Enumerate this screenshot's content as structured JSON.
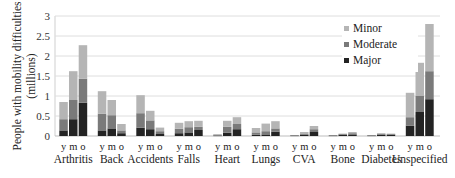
{
  "chart_data": {
    "type": "bar",
    "stacked": true,
    "title": "",
    "xlabel": "",
    "ylabel": [
      "People with mobility difficulties",
      "(millions)"
    ],
    "ylim": [
      0,
      3
    ],
    "yticks": [
      "0",
      "0.5",
      "1",
      "1.5",
      "2",
      "2.5",
      "3"
    ],
    "grid": true,
    "legend_position": "top-right",
    "categories": [
      "Arthritis",
      "Back",
      "Accidents",
      "Falls",
      "Heart",
      "Lungs",
      "CVA",
      "Bone",
      "Diabetes",
      "Unspecified"
    ],
    "subgroups": [
      "y",
      "m",
      "o"
    ],
    "series": [
      {
        "name": "Major",
        "color": "#232323",
        "values": [
          [
            0.14,
            0.42,
            0.83
          ],
          [
            0.14,
            0.19,
            0.07
          ],
          [
            0.21,
            0.17,
            0.05
          ],
          [
            0.07,
            0.09,
            0.15
          ],
          [
            0.01,
            0.08,
            0.17
          ],
          [
            0.03,
            0.04,
            0.11
          ],
          [
            0.01,
            0.03,
            0.1
          ],
          [
            0.01,
            0.03,
            0.04
          ],
          [
            0.01,
            0.03,
            0.03
          ],
          [
            0.26,
            0.6,
            0.92
          ]
        ]
      },
      {
        "name": "Moderate",
        "color": "#7a7a7a",
        "values": [
          [
            0.28,
            0.48,
            0.6
          ],
          [
            0.42,
            0.33,
            0.07
          ],
          [
            0.36,
            0.22,
            0.07
          ],
          [
            0.11,
            0.13,
            0.08
          ],
          [
            0.02,
            0.15,
            0.13
          ],
          [
            0.06,
            0.08,
            0.08
          ],
          [
            0.01,
            0.02,
            0.07
          ],
          [
            0.01,
            0.02,
            0.03
          ],
          [
            0.01,
            0.02,
            0.02
          ],
          [
            0.21,
            0.4,
            0.7
          ]
        ]
      },
      {
        "name": "Minor",
        "color": "#b5b5b5",
        "values": [
          [
            0.43,
            0.72,
            0.84
          ],
          [
            0.56,
            0.38,
            0.16
          ],
          [
            0.45,
            0.24,
            0.09
          ],
          [
            0.15,
            0.15,
            0.15
          ],
          [
            0.02,
            0.15,
            0.17
          ],
          [
            0.11,
            0.19,
            0.18
          ],
          [
            0.0,
            0.05,
            0.08
          ],
          [
            0.0,
            0.01,
            0.03
          ],
          [
            0.0,
            0.02,
            0.01
          ],
          [
            0.61,
            0.83,
            1.18
          ]
        ]
      }
    ],
    "legend": [
      "Minor",
      "Moderate",
      "Major"
    ]
  }
}
